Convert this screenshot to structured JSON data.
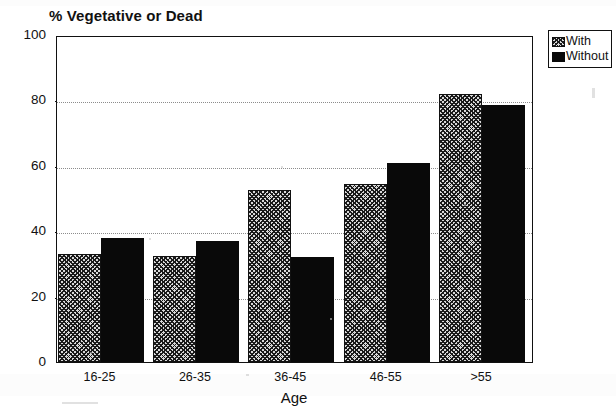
{
  "chart_data": {
    "type": "bar",
    "title": "% Vegetative or Dead",
    "xlabel": "Age",
    "ylabel": "",
    "categories": [
      "16-25",
      "26-35",
      "36-45",
      "46-55",
      ">55"
    ],
    "series": [
      {
        "name": "With",
        "values": [
          33,
          32.5,
          52.5,
          54.5,
          82
        ]
      },
      {
        "name": "Without",
        "values": [
          38,
          37,
          32,
          61,
          78.5
        ]
      }
    ],
    "ylim": [
      0,
      100
    ],
    "yticks": [
      0,
      20,
      40,
      60,
      80,
      100
    ],
    "ytick_labels": [
      "0",
      "20",
      "40",
      "60",
      "80",
      "100"
    ],
    "gridlines": [
      20,
      40,
      60,
      80
    ],
    "grid": true,
    "legend_position": "top-right",
    "colors": {
      "series_with": "#d9d9d9",
      "series_without": "#090909",
      "axis": "#111111",
      "grid": "#8c8c8c",
      "background": "#ffffff"
    }
  },
  "legend": {
    "entries": [
      {
        "label": "With",
        "swatch": "checkered-hatch-swatch"
      },
      {
        "label": "Without",
        "swatch": "solid-black-swatch"
      }
    ]
  }
}
